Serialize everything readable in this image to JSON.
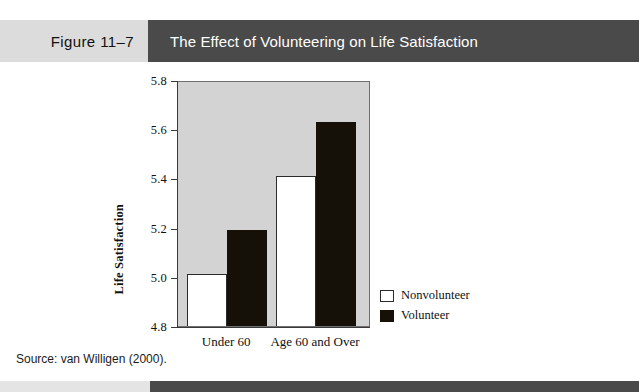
{
  "header": {
    "figure_number": "Figure 11–7",
    "title": "The Effect of Volunteering on Life Satisfaction",
    "band_left_color": "#dcdcdc",
    "band_right_color": "#4a4a4a"
  },
  "footer": {
    "band_left_color": "#e4e4e4",
    "band_right_color": "#4a4a4a"
  },
  "source": {
    "text": "Source: van Willigen (2000)."
  },
  "chart_data": {
    "type": "bar",
    "title": "The Effect of Volunteering on Life Satisfaction",
    "xlabel": "",
    "ylabel": "Life Satisfaction",
    "categories": [
      "Under 60",
      "Age 60 and Over"
    ],
    "series": [
      {
        "name": "Nonvolunteer",
        "color": "#ffffff",
        "values": [
          5.01,
          5.41
        ]
      },
      {
        "name": "Volunteer",
        "color": "#151008",
        "values": [
          5.19,
          5.63
        ]
      }
    ],
    "ylim": [
      4.8,
      5.8
    ],
    "yticks": [
      "4.8",
      "5.0",
      "5.2",
      "5.4",
      "5.6",
      "5.8"
    ],
    "ytick_values": [
      4.8,
      5.0,
      5.2,
      5.4,
      5.6,
      5.8
    ],
    "grid": false,
    "legend_position": "right",
    "plot_background": "#d3d3d3"
  }
}
